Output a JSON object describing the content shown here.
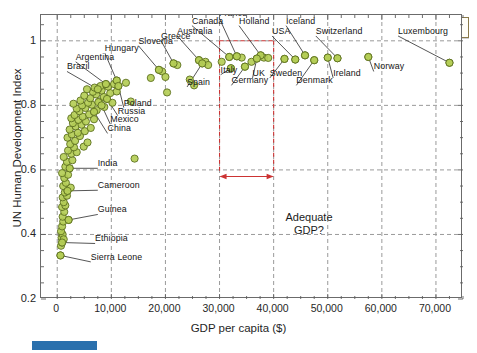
{
  "chart_data": {
    "type": "scatter",
    "title": "Human Development Index",
    "xlabel": "GDP per capita ($)",
    "ylabel": "UN Human Development Index",
    "xlim": [
      -3000,
      75000
    ],
    "ylim": [
      0.2,
      1.08
    ],
    "xticks": [
      "0",
      "10,000",
      "20,000",
      "30,000",
      "40,000",
      "50,000",
      "60,000",
      "70,000"
    ],
    "xtick_values": [
      0,
      10000,
      20000,
      30000,
      40000,
      50000,
      60000,
      70000
    ],
    "yticks": [
      "0.2",
      "0.4",
      "0.6",
      "0.8",
      "1"
    ],
    "ytick_values": [
      0.2,
      0.4,
      0.6,
      0.8,
      1.0
    ],
    "grid": true,
    "legend": "none",
    "marker_fill": "#b4cd56",
    "marker_edge": "#5d7020",
    "watermark": "MFA-11",
    "annotation": {
      "text_line1": "Adequate",
      "text_line2": "GDP?",
      "box_color": "#cc3333",
      "x_range": [
        30000,
        40000
      ],
      "y_range": [
        0.595,
        1.0
      ]
    },
    "labeled_points": [
      {
        "name": "Brazil",
        "x": 7500,
        "y": 0.85,
        "lx": 1800,
        "ly": 0.905,
        "anchor": "start"
      },
      {
        "name": "Argentina",
        "x": 9000,
        "y": 0.866,
        "lx": 3400,
        "ly": 0.935,
        "anchor": "start"
      },
      {
        "name": "Hungary",
        "x": 11000,
        "y": 0.877,
        "lx": 8800,
        "ly": 0.962,
        "anchor": "start"
      },
      {
        "name": "Slovenia",
        "x": 18800,
        "y": 0.91,
        "lx": 15000,
        "ly": 0.985,
        "anchor": "start"
      },
      {
        "name": "Greece",
        "x": 21500,
        "y": 0.93,
        "lx": 19200,
        "ly": 1.0,
        "anchor": "start"
      },
      {
        "name": "Australia",
        "x": 26200,
        "y": 0.94,
        "lx": 22200,
        "ly": 1.015,
        "anchor": "start"
      },
      {
        "name": "Canada",
        "x": 31800,
        "y": 0.95,
        "lx": 24900,
        "ly": 1.047,
        "anchor": "start"
      },
      {
        "name": "France",
        "x": 33200,
        "y": 0.952,
        "lx": 29900,
        "ly": 1.072,
        "anchor": "start"
      },
      {
        "name": "Holland",
        "x": 37600,
        "y": 0.955,
        "lx": 33600,
        "ly": 1.047,
        "anchor": "start"
      },
      {
        "name": "Iceland",
        "x": 45800,
        "y": 0.955,
        "lx": 42300,
        "ly": 1.047,
        "anchor": "start"
      },
      {
        "name": "USA",
        "x": 44000,
        "y": 0.942,
        "lx": 39700,
        "ly": 1.015,
        "anchor": "start"
      },
      {
        "name": "Switzerland",
        "x": 51800,
        "y": 0.946,
        "lx": 47800,
        "ly": 1.015,
        "anchor": "start"
      },
      {
        "name": "Luxembourg",
        "x": 72500,
        "y": 0.932,
        "lx": 63000,
        "ly": 1.015,
        "anchor": "start"
      },
      {
        "name": "Norway",
        "x": 57500,
        "y": 0.95,
        "lx": 58500,
        "ly": 0.905,
        "anchor": "start"
      },
      {
        "name": "Ireland",
        "x": 50000,
        "y": 0.948,
        "lx": 51000,
        "ly": 0.885,
        "anchor": "start"
      },
      {
        "name": "Denmark",
        "x": 47500,
        "y": 0.94,
        "lx": 44200,
        "ly": 0.862,
        "anchor": "start"
      },
      {
        "name": "Sweden",
        "x": 42000,
        "y": 0.944,
        "lx": 39300,
        "ly": 0.885,
        "anchor": "start"
      },
      {
        "name": "UK",
        "x": 36900,
        "y": 0.945,
        "lx": 36100,
        "ly": 0.885,
        "anchor": "start"
      },
      {
        "name": "Germany",
        "x": 34700,
        "y": 0.92,
        "lx": 32200,
        "ly": 0.862,
        "anchor": "start"
      },
      {
        "name": "Italy",
        "x": 32100,
        "y": 0.915,
        "lx": 30200,
        "ly": 0.895,
        "anchor": "start"
      },
      {
        "name": "Spain",
        "x": 26800,
        "y": 0.93,
        "lx": 24000,
        "ly": 0.857,
        "anchor": "start"
      },
      {
        "name": "Poland",
        "x": 11300,
        "y": 0.86,
        "lx": 12300,
        "ly": 0.793,
        "anchor": "start"
      },
      {
        "name": "Russia",
        "x": 9200,
        "y": 0.82,
        "lx": 11200,
        "ly": 0.768,
        "anchor": "start"
      },
      {
        "name": "Mexico",
        "x": 8200,
        "y": 0.8,
        "lx": 9800,
        "ly": 0.742,
        "anchor": "start"
      },
      {
        "name": "China",
        "x": 6800,
        "y": 0.78,
        "lx": 9300,
        "ly": 0.713,
        "anchor": "start"
      },
      {
        "name": "India",
        "x": 2300,
        "y": 0.605,
        "lx": 7500,
        "ly": 0.605,
        "anchor": "start"
      },
      {
        "name": "Cameroon",
        "x": 1900,
        "y": 0.535,
        "lx": 7500,
        "ly": 0.537,
        "anchor": "start"
      },
      {
        "name": "Guinea",
        "x": 2100,
        "y": 0.445,
        "lx": 7500,
        "ly": 0.462,
        "anchor": "start"
      },
      {
        "name": "Ethiopia",
        "x": 900,
        "y": 0.375,
        "lx": 7000,
        "ly": 0.372,
        "anchor": "start"
      },
      {
        "name": "Sierra Leone",
        "x": 600,
        "y": 0.335,
        "lx": 6200,
        "ly": 0.315,
        "anchor": "start"
      }
    ],
    "points": [
      [
        600,
        0.335
      ],
      [
        700,
        0.365
      ],
      [
        900,
        0.375
      ],
      [
        800,
        0.39
      ],
      [
        1000,
        0.4
      ],
      [
        700,
        0.41
      ],
      [
        1200,
        0.385
      ],
      [
        900,
        0.425
      ],
      [
        1100,
        0.44
      ],
      [
        2100,
        0.445
      ],
      [
        1000,
        0.455
      ],
      [
        1300,
        0.47
      ],
      [
        900,
        0.485
      ],
      [
        1500,
        0.49
      ],
      [
        1200,
        0.5
      ],
      [
        1000,
        0.515
      ],
      [
        1800,
        0.52
      ],
      [
        1400,
        0.53
      ],
      [
        1900,
        0.535
      ],
      [
        2500,
        0.545
      ],
      [
        1100,
        0.55
      ],
      [
        1600,
        0.56
      ],
      [
        1300,
        0.575
      ],
      [
        2000,
        0.585
      ],
      [
        900,
        0.59
      ],
      [
        2300,
        0.605
      ],
      [
        1500,
        0.61
      ],
      [
        1800,
        0.625
      ],
      [
        2800,
        0.63
      ],
      [
        1200,
        0.64
      ],
      [
        2600,
        0.65
      ],
      [
        3600,
        0.655
      ],
      [
        2000,
        0.66
      ],
      [
        3100,
        0.67
      ],
      [
        4900,
        0.672
      ],
      [
        2400,
        0.68
      ],
      [
        5600,
        0.685
      ],
      [
        3300,
        0.69
      ],
      [
        1900,
        0.7
      ],
      [
        4200,
        0.705
      ],
      [
        2700,
        0.71
      ],
      [
        3800,
        0.715
      ],
      [
        5100,
        0.72
      ],
      [
        2300,
        0.725
      ],
      [
        6200,
        0.73
      ],
      [
        3400,
        0.735
      ],
      [
        4500,
        0.74
      ],
      [
        2900,
        0.745
      ],
      [
        5300,
        0.75
      ],
      [
        3900,
        0.755
      ],
      [
        6800,
        0.757
      ],
      [
        2600,
        0.76
      ],
      [
        4700,
        0.765
      ],
      [
        3200,
        0.77
      ],
      [
        5900,
        0.772
      ],
      [
        6800,
        0.78
      ],
      [
        4100,
        0.782
      ],
      [
        7300,
        0.785
      ],
      [
        3600,
        0.79
      ],
      [
        5200,
        0.792
      ],
      [
        8700,
        0.795
      ],
      [
        4600,
        0.8
      ],
      [
        6400,
        0.802
      ],
      [
        3000,
        0.805
      ],
      [
        14300,
        0.635
      ],
      [
        9200,
        0.82
      ],
      [
        5700,
        0.808
      ],
      [
        7800,
        0.812
      ],
      [
        4300,
        0.815
      ],
      [
        10200,
        0.808
      ],
      [
        6100,
        0.822
      ],
      [
        8600,
        0.826
      ],
      [
        5000,
        0.83
      ],
      [
        7200,
        0.834
      ],
      [
        9800,
        0.838
      ],
      [
        6600,
        0.842
      ],
      [
        8200,
        0.846
      ],
      [
        5500,
        0.85
      ],
      [
        7500,
        0.85
      ],
      [
        11000,
        0.843
      ],
      [
        6900,
        0.855
      ],
      [
        9400,
        0.858
      ],
      [
        8000,
        0.86
      ],
      [
        11300,
        0.86
      ],
      [
        10500,
        0.866
      ],
      [
        9000,
        0.866
      ],
      [
        12700,
        0.87
      ],
      [
        11000,
        0.877
      ],
      [
        7600,
        0.81
      ],
      [
        13600,
        0.812
      ],
      [
        17300,
        0.885
      ],
      [
        18800,
        0.91
      ],
      [
        19400,
        0.905
      ],
      [
        20000,
        0.888
      ],
      [
        20300,
        0.84
      ],
      [
        21500,
        0.93
      ],
      [
        22200,
        0.925
      ],
      [
        24500,
        0.88
      ],
      [
        25300,
        0.862
      ],
      [
        26200,
        0.94
      ],
      [
        26800,
        0.93
      ],
      [
        27400,
        0.935
      ],
      [
        27900,
        0.925
      ],
      [
        30400,
        0.935
      ],
      [
        31800,
        0.95
      ],
      [
        32100,
        0.915
      ],
      [
        33200,
        0.952
      ],
      [
        34100,
        0.948
      ],
      [
        34700,
        0.92
      ],
      [
        35900,
        0.935
      ],
      [
        36900,
        0.945
      ],
      [
        37600,
        0.955
      ],
      [
        38200,
        0.948
      ],
      [
        39000,
        0.947
      ],
      [
        42000,
        0.944
      ],
      [
        44000,
        0.942
      ],
      [
        45800,
        0.955
      ],
      [
        47500,
        0.94
      ],
      [
        50000,
        0.948
      ],
      [
        51800,
        0.946
      ],
      [
        57500,
        0.95
      ],
      [
        72500,
        0.932
      ]
    ]
  }
}
